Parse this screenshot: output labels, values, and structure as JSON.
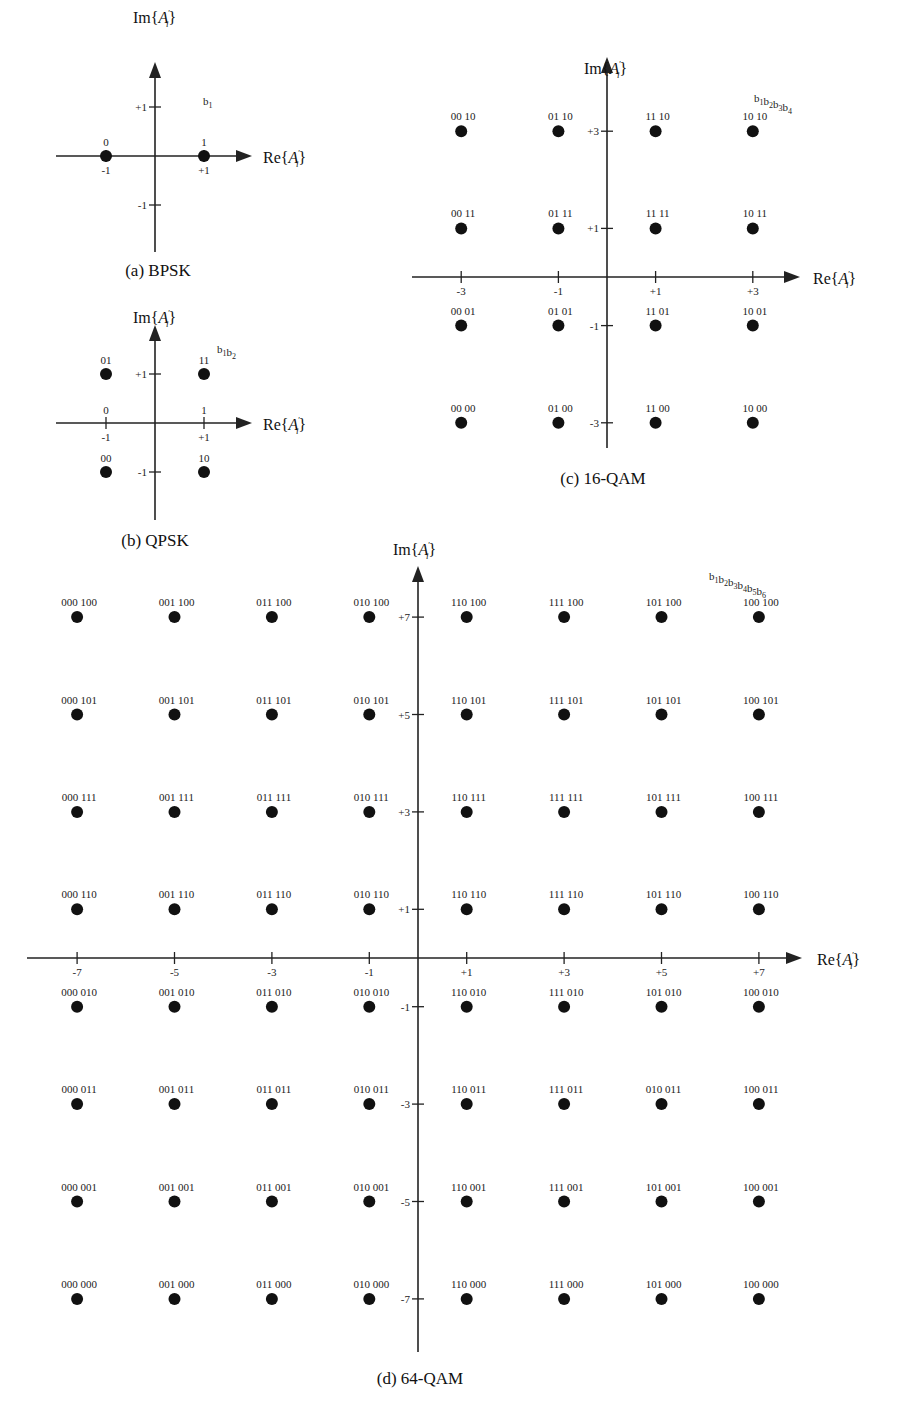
{
  "figure": {
    "panels": [
      {
        "id": "bpsk",
        "caption": "(a) BPSK",
        "x_axis_label": "Re{A'i}",
        "y_axis_label": "Im{A'i}",
        "bit_order_label": "b1",
        "x_ticks": [
          "-1",
          "+1"
        ],
        "y_ticks": [
          "+1",
          "-1"
        ]
      },
      {
        "id": "qpsk",
        "caption": "(b) QPSK",
        "x_axis_label": "Re{A'i}",
        "y_axis_label": "Im{A'i}",
        "bit_order_label": "b1b2",
        "x_ticks": [
          "-1",
          "+1"
        ],
        "y_ticks": [
          "+1",
          "-1"
        ],
        "x_bit_labels": [
          "0",
          "1"
        ]
      },
      {
        "id": "qam16",
        "caption": "(c) 16-QAM",
        "x_axis_label": "Re{A'i}",
        "y_axis_label": "Im{A'i}",
        "bit_order_label": "b1b2b3b4",
        "x_ticks": [
          "-3",
          "-1",
          "+1",
          "+3"
        ],
        "y_ticks": [
          "+3",
          "+1",
          "-1",
          "-3"
        ]
      },
      {
        "id": "qam64",
        "caption": "(d) 64-QAM",
        "x_axis_label": "Re{A'i}",
        "y_axis_label": "Im{A'i}",
        "bit_order_label": "b1b2b3b4b5b6",
        "x_ticks": [
          "-7",
          "-5",
          "-3",
          "-1",
          "+1",
          "+3",
          "+5",
          "+7"
        ],
        "y_ticks": [
          "+7",
          "+5",
          "+3",
          "+1",
          "-1",
          "-3",
          "-5",
          "-7"
        ]
      }
    ]
  },
  "chart_data": [
    {
      "type": "scatter",
      "title": "(a) BPSK",
      "xlabel": "Re{A'i}",
      "ylabel": "Im{A'i}",
      "xlim": [
        -1,
        1
      ],
      "ylim": [
        -1,
        1
      ],
      "grid": false,
      "points": [
        {
          "x": -1,
          "y": 0,
          "label": "0"
        },
        {
          "x": 1,
          "y": 0,
          "label": "1"
        }
      ]
    },
    {
      "type": "scatter",
      "title": "(b) QPSK",
      "xlabel": "Re{A'i}",
      "ylabel": "Im{A'i}",
      "xlim": [
        -1,
        1
      ],
      "ylim": [
        -1,
        1
      ],
      "grid": false,
      "points": [
        {
          "x": -1,
          "y": 1,
          "label": "01"
        },
        {
          "x": 1,
          "y": 1,
          "label": "11"
        },
        {
          "x": -1,
          "y": -1,
          "label": "00"
        },
        {
          "x": 1,
          "y": -1,
          "label": "10"
        }
      ]
    },
    {
      "type": "scatter",
      "title": "(c) 16-QAM",
      "xlabel": "Re{A'i}",
      "ylabel": "Im{A'i}",
      "xlim": [
        -3,
        3
      ],
      "ylim": [
        -3,
        3
      ],
      "grid": false,
      "x": [
        -3,
        -1,
        1,
        3
      ],
      "y": [
        3,
        1,
        -1,
        -3
      ],
      "labels": [
        [
          "00 10",
          "01 10",
          "11 10",
          "10 10"
        ],
        [
          "00 11",
          "01 11",
          "11 11",
          "10 11"
        ],
        [
          "00 01",
          "01 01",
          "11 01",
          "10 01"
        ],
        [
          "00 00",
          "01 00",
          "11 00",
          "10 00"
        ]
      ]
    },
    {
      "type": "scatter",
      "title": "(d) 64-QAM",
      "xlabel": "Re{A'i}",
      "ylabel": "Im{A'i}",
      "xlim": [
        -7,
        7
      ],
      "ylim": [
        -7,
        7
      ],
      "grid": false,
      "x": [
        -7,
        -5,
        -3,
        -1,
        1,
        3,
        5,
        7
      ],
      "y": [
        7,
        5,
        3,
        1,
        -1,
        -3,
        -5,
        -7
      ],
      "labels": [
        [
          "000 100",
          "001 100",
          "011 100",
          "010 100",
          "110 100",
          "111 100",
          "101 100",
          "100 100"
        ],
        [
          "000 101",
          "001 101",
          "011 101",
          "010 101",
          "110 101",
          "111 101",
          "101 101",
          "100 101"
        ],
        [
          "000 111",
          "001 111",
          "011 111",
          "010 111",
          "110 111",
          "111 111",
          "101 111",
          "100 111"
        ],
        [
          "000 110",
          "001 110",
          "011 110",
          "010 110",
          "110 110",
          "111 110",
          "101 110",
          "100 110"
        ],
        [
          "000 010",
          "001 010",
          "011 010",
          "010 010",
          "110 010",
          "111 010",
          "101 010",
          "100 010"
        ],
        [
          "000 011",
          "001 011",
          "011 011",
          "010 011",
          "110 011",
          "111 011",
          "010 011",
          "100 011"
        ],
        [
          "000 001",
          "001 001",
          "011 001",
          "010 001",
          "110 001",
          "111 001",
          "101 001",
          "100 001"
        ],
        [
          "000 000",
          "001 000",
          "011 000",
          "010 000",
          "110 000",
          "111 000",
          "101 000",
          "100 000"
        ]
      ]
    }
  ]
}
